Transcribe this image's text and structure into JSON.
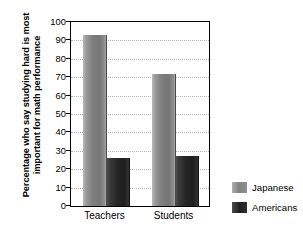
{
  "chart_data": {
    "type": "bar",
    "title": "",
    "subtitle": "",
    "xlabel": "",
    "ylabel": "Percentage who say studying hard is most important for math performance",
    "ylabel_lines": [
      "Percentage who say studying hard is most",
      "important for math performance"
    ],
    "categories": [
      "Teachers",
      "Students"
    ],
    "series": [
      {
        "name": "Japanese",
        "color": "#828282",
        "values": [
          93,
          72
        ]
      },
      {
        "name": "Americans",
        "color": "#262626",
        "values": [
          26,
          27
        ]
      }
    ],
    "ylim": [
      0,
      100
    ],
    "ytick_step": 10,
    "yticks": [
      0,
      10,
      20,
      30,
      40,
      50,
      60,
      70,
      80,
      90,
      100
    ],
    "ytick_labels": [
      "0",
      "10",
      "20",
      "30",
      "40",
      "50",
      "60",
      "70",
      "80",
      "90",
      "100"
    ],
    "grid": {
      "horizontal": true,
      "vertical": false,
      "style": "dotted",
      "color": "#b4b4b4"
    },
    "legend": {
      "position": "right-bottom",
      "entries": [
        {
          "label": "Japanese",
          "color": "#828282"
        },
        {
          "label": "Americans",
          "color": "#262626"
        }
      ]
    },
    "frame": {
      "border_color": "#000000",
      "background": "#ffffff"
    }
  }
}
